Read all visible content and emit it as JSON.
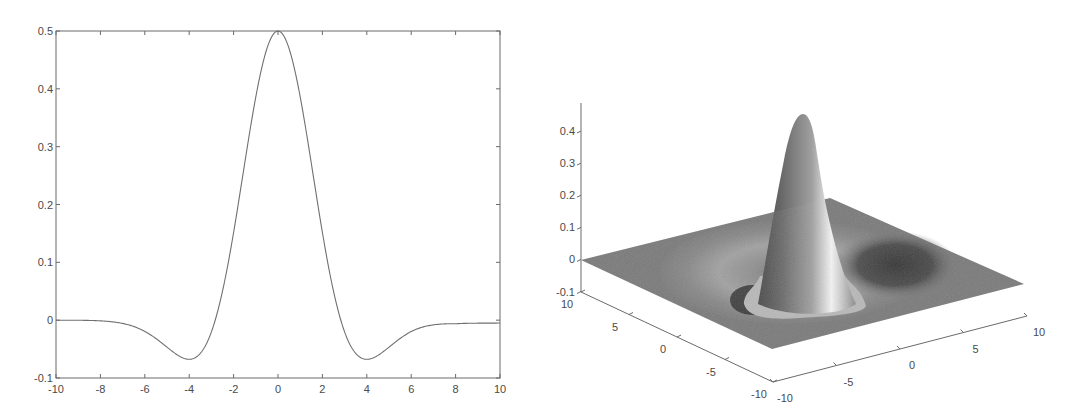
{
  "chart_data": [
    {
      "type": "line",
      "title": "",
      "xlabel": "",
      "ylabel": "",
      "xlim": [
        -10,
        10
      ],
      "ylim": [
        -0.1,
        0.5
      ],
      "grid": false,
      "legend": null,
      "x_ticks": [
        "-10",
        "-8",
        "-6",
        "-4",
        "-2",
        "0",
        "2",
        "4",
        "6",
        "8",
        "10"
      ],
      "y_ticks": [
        "-0.1",
        "0",
        "0.1",
        "0.2",
        "0.3",
        "0.4",
        "0.5"
      ],
      "series": [
        {
          "name": "profile",
          "x": [
            -10,
            -9,
            -8,
            -7,
            -6,
            -5,
            -4,
            -3,
            -2,
            -1,
            0,
            1,
            2,
            3,
            4,
            5,
            6,
            7,
            8,
            9,
            10
          ],
          "y": [
            0.0,
            -0.0005,
            -0.002,
            -0.008,
            -0.025,
            -0.05,
            -0.068,
            -0.04,
            0.12,
            0.37,
            0.5,
            0.37,
            0.12,
            -0.04,
            -0.068,
            -0.05,
            -0.025,
            -0.012,
            -0.006,
            -0.005,
            -0.005
          ]
        }
      ],
      "annotations": {
        "peak": {
          "x": 0,
          "y": 0.5
        },
        "minima": [
          {
            "x": -4,
            "y": -0.068
          },
          {
            "x": 4,
            "y": -0.068
          }
        ]
      }
    },
    {
      "type": "surface3d",
      "title": "",
      "xlim": [
        -10,
        10
      ],
      "ylim": [
        -10,
        10
      ],
      "zlim": [
        -0.1,
        0.45
      ],
      "z_ticks": [
        "-0.1",
        "0",
        "0.1",
        "0.2",
        "0.3",
        "0.4"
      ],
      "left_axis_ticks": [
        "10",
        "5",
        "0",
        "-5",
        "-10"
      ],
      "right_axis_ticks": [
        "-10",
        "-5",
        "0",
        "5",
        "10"
      ],
      "description": "Radially symmetric surface: single sharp peak (~0.45) at origin surrounded by a shallow negative ring, flat near 0 at edges",
      "shading": "grayscale lit surface",
      "peak": {
        "x": 0,
        "y": 0,
        "z": 0.45
      }
    }
  ],
  "colors": {
    "curve": "#707070",
    "axis": "#6a6a6a",
    "text": "#4a4a4a",
    "surface_base": "#7a7a7a",
    "surface_dark": "#3c3c3c",
    "surface_light": "#d8d8d8"
  }
}
